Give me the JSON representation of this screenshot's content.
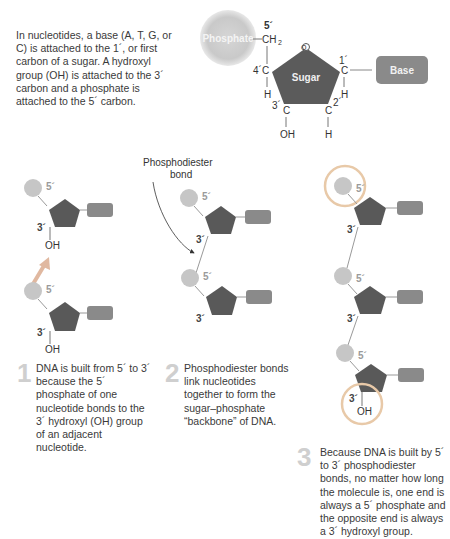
{
  "intro": {
    "text": "In nucleotides, a base (A, T, G, or C) is attached to the 1´, or first carbon of a sugar. A hydroxyl group (OH) is attached to the 3´ carbon and a phosphate is attached to the 5´ carbon."
  },
  "nucleotide": {
    "phosphate": "Phosphate",
    "sugar": "Sugar",
    "base": "Base",
    "ch2": "CH",
    "ch2_sub": "2",
    "c5": "5´",
    "c4": "4´C",
    "c1": "1´",
    "c3": "3´",
    "c2": "2´",
    "c": "C",
    "h": "H",
    "oh": "OH",
    "o": "O"
  },
  "labels": {
    "five_prime": "5´",
    "three_prime": "3´",
    "oh": "OH",
    "bond_line1": "Phosphodiester",
    "bond_line2": "bond"
  },
  "steps": [
    {
      "num": "1",
      "text": "DNA is built from 5´ to 3´ because the 5´ phosphate of one nucleotide bonds to the 3´ hydroxyl (OH) group of an adjacent nucleotide."
    },
    {
      "num": "2",
      "text": "Phosphodiester bonds link nucleotides together to form the sugar–phosphate “backbone” of DNA."
    },
    {
      "num": "3",
      "text": "Because DNA is built by 5´ to 3´ phosphodiester bonds, no matter how long the molecule is, one end is always a 5´ phosphate and the opposite end is always a 3´ hydroxyl group."
    }
  ],
  "colors": {
    "sugar": "#5a5a5a",
    "base": "#8c8c8c",
    "phosphate": "#c8c8c8",
    "highlight_ring": "#e8c9a8",
    "arrow": "#e0b8a0"
  }
}
